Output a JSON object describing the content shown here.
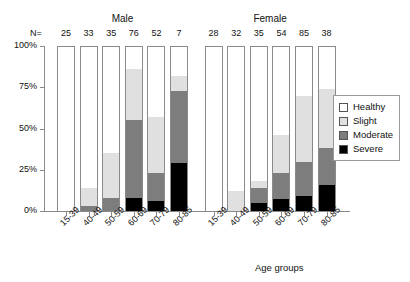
{
  "chart_data": {
    "type": "bar",
    "subtype": "stacked-percentage",
    "title": "",
    "xlabel": "Age groups",
    "ylabel": "",
    "ylim": [
      0,
      100
    ],
    "ytick_labels": [
      "0%",
      "25%",
      "50%",
      "75%",
      "100%"
    ],
    "ytick_values": [
      0,
      25,
      50,
      75,
      100
    ],
    "grid": false,
    "legend_position": "right",
    "categories": [
      "15-39",
      "40-49",
      "50-59",
      "60-69",
      "70-79",
      "80-85"
    ],
    "groups": [
      {
        "name": "Male",
        "n_values": [
          25,
          33,
          35,
          76,
          52,
          7
        ],
        "bars": [
          {
            "category": "15-39",
            "n": 25,
            "healthy": 100,
            "slight": 0,
            "moderate": 0,
            "severe": 0
          },
          {
            "category": "40-49",
            "n": 33,
            "healthy": 86,
            "slight": 11,
            "moderate": 3,
            "severe": 0
          },
          {
            "category": "50-59",
            "n": 35,
            "healthy": 65,
            "slight": 27,
            "moderate": 8,
            "severe": 0
          },
          {
            "category": "60-69",
            "n": 76,
            "healthy": 14,
            "slight": 31,
            "moderate": 47,
            "severe": 8
          },
          {
            "category": "70-79",
            "n": 52,
            "healthy": 43,
            "slight": 34,
            "moderate": 17,
            "severe": 6
          },
          {
            "category": "80-85",
            "n": 7,
            "healthy": 18,
            "slight": 9,
            "moderate": 44,
            "severe": 29
          }
        ]
      },
      {
        "name": "Female",
        "n_values": [
          28,
          32,
          35,
          54,
          85,
          38
        ],
        "bars": [
          {
            "category": "15-39",
            "n": 28,
            "healthy": 100,
            "slight": 0,
            "moderate": 0,
            "severe": 0
          },
          {
            "category": "40-49",
            "n": 32,
            "healthy": 88,
            "slight": 12,
            "moderate": 0,
            "severe": 0
          },
          {
            "category": "50-59",
            "n": 35,
            "healthy": 82,
            "slight": 4,
            "moderate": 9,
            "severe": 5
          },
          {
            "category": "60-69",
            "n": 54,
            "healthy": 54,
            "slight": 23,
            "moderate": 16,
            "severe": 7
          },
          {
            "category": "70-79",
            "n": 85,
            "healthy": 30,
            "slight": 40,
            "moderate": 21,
            "severe": 9
          },
          {
            "category": "80-85",
            "n": 38,
            "healthy": 26,
            "slight": 36,
            "moderate": 22,
            "severe": 16
          }
        ]
      }
    ],
    "series": [
      {
        "name": "Healthy",
        "color": "#ffffff"
      },
      {
        "name": "Slight",
        "color": "#e0e0e0"
      },
      {
        "name": "Moderate",
        "color": "#7d7d7d"
      },
      {
        "name": "Severe",
        "color": "#000000"
      }
    ]
  },
  "labels": {
    "n_prefix": "N=",
    "axis_title": "Age groups"
  },
  "legend": {
    "items": [
      {
        "label": "Healthy",
        "color": "#ffffff"
      },
      {
        "label": "Slight",
        "color": "#e0e0e0"
      },
      {
        "label": "Moderate",
        "color": "#7d7d7d"
      },
      {
        "label": "Severe",
        "color": "#000000"
      }
    ]
  }
}
